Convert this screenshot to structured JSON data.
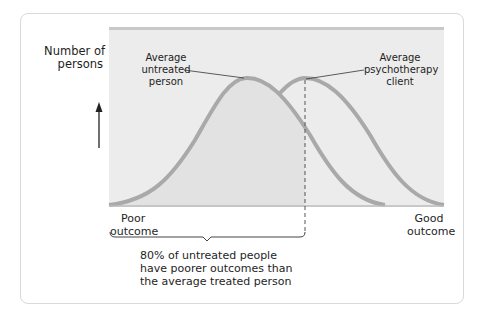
{
  "figure": {
    "y_axis_label_line1": "Number of",
    "y_axis_label_line2": "persons",
    "x_left_label_line1": "Poor",
    "x_left_label_line2": "outcome",
    "x_right_label_line1": "Good",
    "x_right_label_line2": "outcome",
    "annotation_untreated_line1": "Average",
    "annotation_untreated_line2": "untreated",
    "annotation_untreated_line3": "person",
    "annotation_treated_line1": "Average",
    "annotation_treated_line2": "psychotherapy",
    "annotation_treated_line3": "client",
    "caption_line1": "80% of untreated people",
    "caption_line2": "have poorer outcomes than",
    "caption_line3": "the average treated person",
    "colors": {
      "plot_background": "#ececec",
      "top_band": "#c8c8c8",
      "curve": "#a9a9a9",
      "shaded_area": "#e2e2e2",
      "card_border": "#d9d9d9",
      "text": "#1e1e1e"
    }
  }
}
